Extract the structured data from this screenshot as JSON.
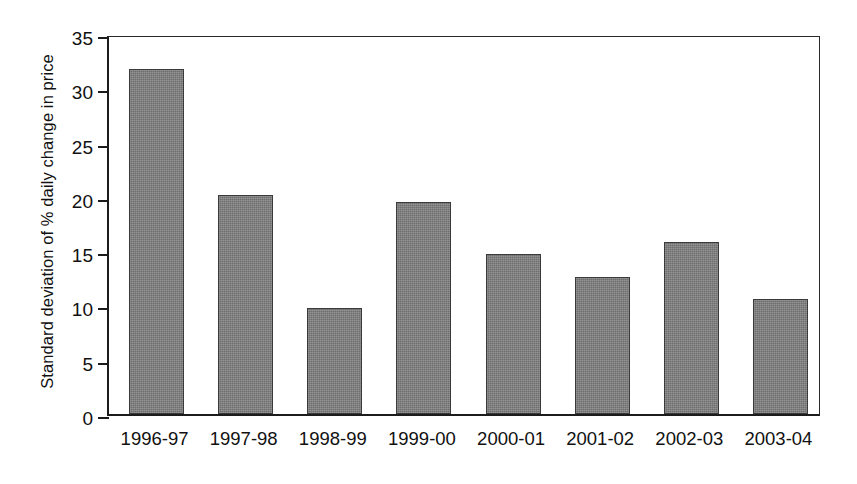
{
  "chart_data": {
    "type": "bar",
    "title": "",
    "subtitle": "",
    "xlabel": "",
    "ylabel": "Standard deviation of % daily change in price",
    "categories": [
      "1996-97",
      "1997-98",
      "1998-99",
      "1999-00",
      "2000-01",
      "2001-02",
      "2002-03",
      "2003-04"
    ],
    "values": [
      31.8,
      20.2,
      9.8,
      19.5,
      14.7,
      12.6,
      15.8,
      10.6
    ],
    "ylim": [
      0,
      35
    ],
    "ytick_labels": [
      "0",
      "5",
      "10",
      "15",
      "20",
      "25",
      "30",
      "35"
    ],
    "ytick_values": [
      0,
      5,
      10,
      15,
      20,
      25,
      30,
      35
    ],
    "ytick_step": 5,
    "grid": false,
    "legend": null,
    "legend_position": "none",
    "annotations": [],
    "series": [
      {
        "name": "Standard deviation of % daily change in price",
        "values": [
          31.8,
          20.2,
          9.8,
          19.5,
          14.7,
          12.6,
          15.8,
          10.6
        ]
      }
    ],
    "colors": {
      "bar_fill": "#7b7b7b",
      "bar_border": "#3a3a3a",
      "axis": "#1c1c1c",
      "text": "#111111",
      "background": "#ffffff"
    }
  }
}
